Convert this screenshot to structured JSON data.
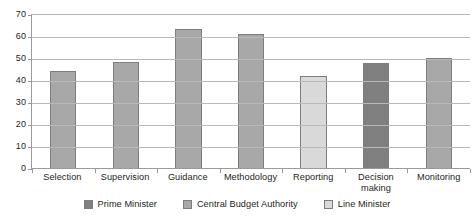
{
  "chart_data": {
    "type": "bar",
    "title": "",
    "subtitle": "",
    "xlabel": "",
    "ylabel": "",
    "categories": [
      "Selection",
      "Supervision",
      "Guidance",
      "Methodology",
      "Reporting",
      "Decision making",
      "Monitoring"
    ],
    "category_lines": [
      [
        "Selection"
      ],
      [
        "Supervision"
      ],
      [
        "Guidance"
      ],
      [
        "Methodology"
      ],
      [
        "Reporting"
      ],
      [
        "Decision",
        "making"
      ],
      [
        "Monitoring"
      ]
    ],
    "values": [
      44.5,
      48.5,
      63.5,
      61.5,
      42.5,
      48,
      50.5
    ],
    "series": [
      {
        "name": "Central Budget Authority",
        "values": [
          44.5,
          48.5,
          63.5,
          61.5,
          null,
          null,
          50.5
        ]
      },
      {
        "name": "Line Minister",
        "values": [
          null,
          null,
          null,
          null,
          42.5,
          null,
          null
        ]
      },
      {
        "name": "Prime Minister",
        "values": [
          null,
          null,
          null,
          null,
          null,
          48,
          null
        ]
      }
    ],
    "bar_series_assignment": [
      "Central Budget Authority",
      "Central Budget Authority",
      "Central Budget Authority",
      "Central Budget Authority",
      "Line Minister",
      "Prime Minister",
      "Central Budget Authority"
    ],
    "ylim": [
      0,
      70
    ],
    "ytick_labels": [
      "70",
      "60",
      "50",
      "40",
      "30",
      "20",
      "10",
      "0"
    ],
    "ytick_values": [
      70,
      60,
      50,
      40,
      30,
      20,
      10,
      0
    ],
    "ytick_step": 10,
    "grid": true,
    "legend_position": "bottom",
    "legend": [
      {
        "label": "Prime Minister",
        "color": "#808080"
      },
      {
        "label": "Central Budget Authority",
        "color": "#a8a8a8"
      },
      {
        "label": "Line Minister",
        "color": "#d9d9d9"
      }
    ],
    "colors": {
      "prime_minister": "#808080",
      "central_budget_authority": "#a8a8a8",
      "line_minister": "#d9d9d9",
      "bar_border": "#7d7d7d",
      "gridline": "#b9b9b9",
      "axis": "#9a9a9a",
      "text": "#231f20",
      "background": "#ffffff"
    }
  }
}
